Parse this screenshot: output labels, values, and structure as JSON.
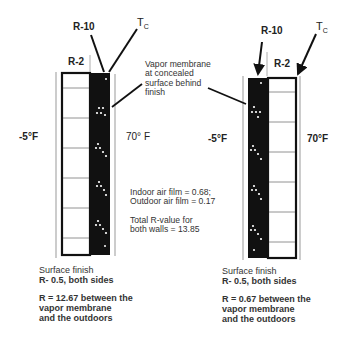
{
  "left_wall": {
    "labels": {
      "r10": "R-10",
      "r2": "R-2",
      "tc_main": "T",
      "tc_sub": "C",
      "outdoor_temp": "-5°F",
      "indoor_temp": "70° F"
    },
    "caption": {
      "finish_title": "Surface finish",
      "finish_value": "R- 0.5, both sides",
      "result_line1": "R = 12.67 between the",
      "result_line2": "vapor membrane",
      "result_line3": "and the outdoors"
    }
  },
  "right_wall": {
    "labels": {
      "r10": "R-10",
      "r2": "R-2",
      "tc_main": "T",
      "tc_sub": "C",
      "outdoor_temp": "-5°F",
      "indoor_temp": "70°F"
    },
    "caption": {
      "finish_title": "Surface finish",
      "finish_value": "R- 0.5, both sides",
      "result_line1": "R = 0.67 between the",
      "result_line2": "vapor membrane",
      "result_line3": "and the outdoors"
    }
  },
  "center_notes": {
    "vapor_line1": "Vapor membrane",
    "vapor_line2": "at concealed",
    "vapor_line3": "surface behind",
    "vapor_line4": "finish",
    "film_line1": "Indoor air film = 0.68;",
    "film_line2": "Outdoor air film = 0.17",
    "total_line1": "Total R-value for",
    "total_line2": "both walls = 13.85"
  },
  "colors": {
    "insulation_dark": "#111111",
    "line": "#1a1a1a",
    "thin_line": "#888888"
  }
}
